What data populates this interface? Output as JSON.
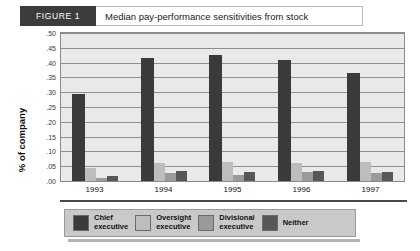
{
  "header": {
    "figure_tag": "FIGURE 1",
    "title": "Median pay-performance sensitivities from stock"
  },
  "legend": {
    "items": [
      {
        "label": "Chief\nexecutive",
        "color": "#3a3a3a"
      },
      {
        "label": "Oversight\nexecutive",
        "color": "#bdbdbd"
      },
      {
        "label": "Divisional\nexecutive",
        "color": "#9a9a9a"
      },
      {
        "label": "Neither",
        "color": "#575757"
      }
    ]
  },
  "chart_data": {
    "type": "bar",
    "title": "Median pay-performance sensitivities from stock",
    "xlabel": "",
    "ylabel": "% of company",
    "categories": [
      "1993",
      "1994",
      "1995",
      "1996",
      "1997"
    ],
    "ylim": [
      0,
      0.5
    ],
    "yticks": [
      ".50",
      ".45",
      ".40",
      ".35",
      ".30",
      ".25",
      ".20",
      ".15",
      ".10",
      ".05",
      ".00"
    ],
    "ytick_values": [
      0.5,
      0.45,
      0.4,
      0.35,
      0.3,
      0.25,
      0.2,
      0.15,
      0.1,
      0.05,
      0.0
    ],
    "grid": true,
    "legend_position": "bottom",
    "series": [
      {
        "name": "Chief executive",
        "color": "#3a3a3a",
        "values": [
          0.295,
          0.415,
          0.425,
          0.41,
          0.365
        ]
      },
      {
        "name": "Oversight executive",
        "color": "#bdbdbd",
        "values": [
          0.045,
          0.06,
          0.065,
          0.06,
          0.065
        ]
      },
      {
        "name": "Divisional executive",
        "color": "#9a9a9a",
        "values": [
          0.01,
          0.028,
          0.022,
          0.03,
          0.028
        ]
      },
      {
        "name": "Neither",
        "color": "#575757",
        "values": [
          0.018,
          0.035,
          0.032,
          0.035,
          0.03
        ]
      }
    ]
  }
}
